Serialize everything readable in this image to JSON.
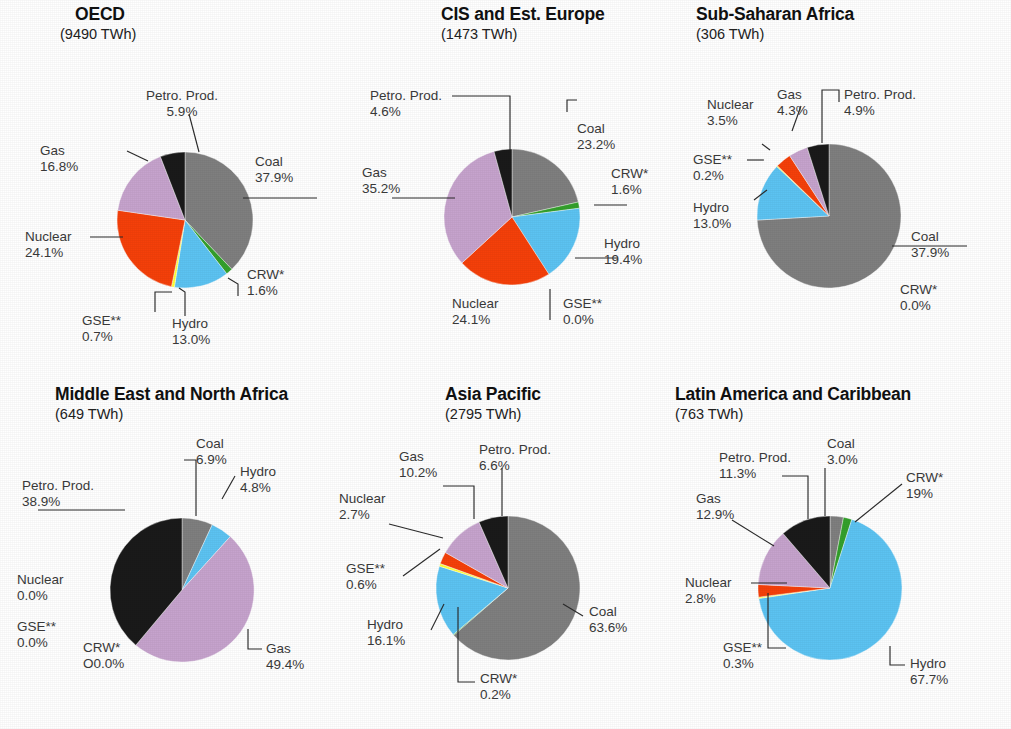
{
  "figure": {
    "background": "#ffffff",
    "width": 1011,
    "height": 729
  },
  "colors": {
    "coal": "#7f7f7f",
    "crw": "#34a02c",
    "hydro": "#5cc3f2",
    "gse": "#ffff33",
    "nuclear": "#f5400a",
    "gas": "#c6a3cd",
    "petro": "#1a1a1a"
  },
  "chart_data": [
    {
      "type": "pie",
      "title": "OECD",
      "subtitle": "(9490 TWh)",
      "total_twh": 9490,
      "categories": [
        "Coal",
        "CRW*",
        "Hydro",
        "GSE**",
        "Nuclear",
        "Gas",
        "Petro. Prod."
      ],
      "values": [
        37.9,
        1.6,
        13.0,
        0.7,
        24.1,
        16.8,
        5.9
      ],
      "labels": [
        {
          "name": "Coal",
          "value": "37.9%"
        },
        {
          "name": "CRW*",
          "value": "1.6%"
        },
        {
          "name": "Hydro",
          "value": "13.0%"
        },
        {
          "name": "GSE**",
          "value": "0.7%"
        },
        {
          "name": "Nuclear",
          "value": "24.1%"
        },
        {
          "name": "Gas",
          "value": "16.8%"
        },
        {
          "name": "Petro. Prod.",
          "value": "5.9%"
        }
      ]
    },
    {
      "type": "pie",
      "title": "CIS and Est. Europe",
      "subtitle": "(1473 TWh)",
      "total_twh": 1473,
      "categories": [
        "Coal",
        "CRW*",
        "Hydro",
        "GSE**",
        "Nuclear",
        "Gas",
        "Petro. Prod."
      ],
      "values": [
        23.2,
        1.6,
        19.4,
        0.0,
        24.1,
        35.2,
        4.6
      ],
      "labels": [
        {
          "name": "Coal",
          "value": "23.2%"
        },
        {
          "name": "CRW*",
          "value": "1.6%"
        },
        {
          "name": "Hydro",
          "value": "19.4%"
        },
        {
          "name": "GSE**",
          "value": "0.0%"
        },
        {
          "name": "Nuclear",
          "value": "24.1%"
        },
        {
          "name": "Gas",
          "value": "35.2%"
        },
        {
          "name": "Petro. Prod.",
          "value": "4.6%"
        }
      ]
    },
    {
      "type": "pie",
      "title": "Sub-Saharan Africa",
      "subtitle": "(306 TWh)",
      "total_twh": 306,
      "categories": [
        "Coal",
        "CRW*",
        "Hydro",
        "GSE**",
        "Nuclear",
        "Gas",
        "Petro. Prod."
      ],
      "values": [
        74.1,
        0.0,
        13.0,
        0.2,
        3.5,
        4.3,
        4.9
      ],
      "labels": [
        {
          "name": "Coal",
          "value": "37.9%"
        },
        {
          "name": "CRW*",
          "value": "0.0%"
        },
        {
          "name": "Hydro",
          "value": "13.0%"
        },
        {
          "name": "GSE**",
          "value": "0.2%"
        },
        {
          "name": "Nuclear",
          "value": "3.5%"
        },
        {
          "name": "Gas",
          "value": "4.3%"
        },
        {
          "name": "Petro. Prod.",
          "value": "4.9%"
        }
      ]
    },
    {
      "type": "pie",
      "title": "Middle East and North Africa",
      "subtitle": "(649 TWh)",
      "total_twh": 649,
      "categories": [
        "Coal",
        "CRW*",
        "Hydro",
        "GSE**",
        "Nuclear",
        "Gas",
        "Petro. Prod."
      ],
      "values": [
        6.9,
        0.0,
        4.8,
        0.0,
        0.0,
        49.4,
        38.9
      ],
      "labels": [
        {
          "name": "Coal",
          "value": "6.9%"
        },
        {
          "name": "CRW*",
          "value": "O0.0%"
        },
        {
          "name": "Hydro",
          "value": "4.8%"
        },
        {
          "name": "GSE**",
          "value": "0.0%"
        },
        {
          "name": "Nuclear",
          "value": "0.0%"
        },
        {
          "name": "Gas",
          "value": "49.4%"
        },
        {
          "name": "Petro. Prod.",
          "value": "38.9%"
        }
      ]
    },
    {
      "type": "pie",
      "title": "Asia Pacific",
      "subtitle": "(2795 TWh)",
      "total_twh": 2795,
      "categories": [
        "Coal",
        "CRW*",
        "Hydro",
        "GSE**",
        "Nuclear",
        "Gas",
        "Petro. Prod."
      ],
      "values": [
        63.6,
        0.2,
        16.1,
        0.6,
        2.7,
        10.2,
        6.6
      ],
      "labels": [
        {
          "name": "Coal",
          "value": "63.6%"
        },
        {
          "name": "CRW*",
          "value": "0.2%"
        },
        {
          "name": "Hydro",
          "value": "16.1%"
        },
        {
          "name": "GSE**",
          "value": "0.6%"
        },
        {
          "name": "Nuclear",
          "value": "2.7%"
        },
        {
          "name": "Gas",
          "value": "10.2%"
        },
        {
          "name": "Petro. Prod.",
          "value": "6.6%"
        }
      ]
    },
    {
      "type": "pie",
      "title": "Latin America and Caribbean",
      "subtitle": "(763 TWh)",
      "total_twh": 763,
      "categories": [
        "Coal",
        "CRW*",
        "Hydro",
        "GSE**",
        "Nuclear",
        "Gas",
        "Petro. Prod."
      ],
      "values": [
        3.0,
        1.9,
        67.7,
        0.3,
        2.8,
        12.9,
        11.3
      ],
      "labels": [
        {
          "name": "Coal",
          "value": "3.0%"
        },
        {
          "name": "CRW*",
          "value": "19%"
        },
        {
          "name": "Hydro",
          "value": "67.7%"
        },
        {
          "name": "GSE**",
          "value": "0.3%"
        },
        {
          "name": "Nuclear",
          "value": "2.8%"
        },
        {
          "name": "Gas",
          "value": "12.9%"
        },
        {
          "name": "Petro. Prod.",
          "value": "11.3%"
        }
      ]
    }
  ]
}
